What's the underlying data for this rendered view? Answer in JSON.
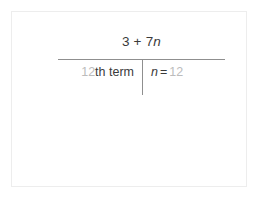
{
  "card": {
    "border_color": "#ededed",
    "background": "#ffffff"
  },
  "expression": {
    "numerator": {
      "coefficient_term": "3 + 7",
      "variable": "n",
      "full_text": "3 + 7n"
    },
    "rule_color": "#8f8f8f",
    "left_cell": {
      "ordinal_number": "12",
      "ordinal_suffix_label": "th term",
      "full_text": "12th term"
    },
    "right_cell": {
      "variable": "n",
      "equals": "=",
      "value": "12",
      "full_text": "n = 12"
    }
  },
  "colors": {
    "text": "#3a3a3a",
    "muted_text": "#bcbcbc",
    "rule": "#8f8f8f",
    "card_border": "#ededed"
  }
}
